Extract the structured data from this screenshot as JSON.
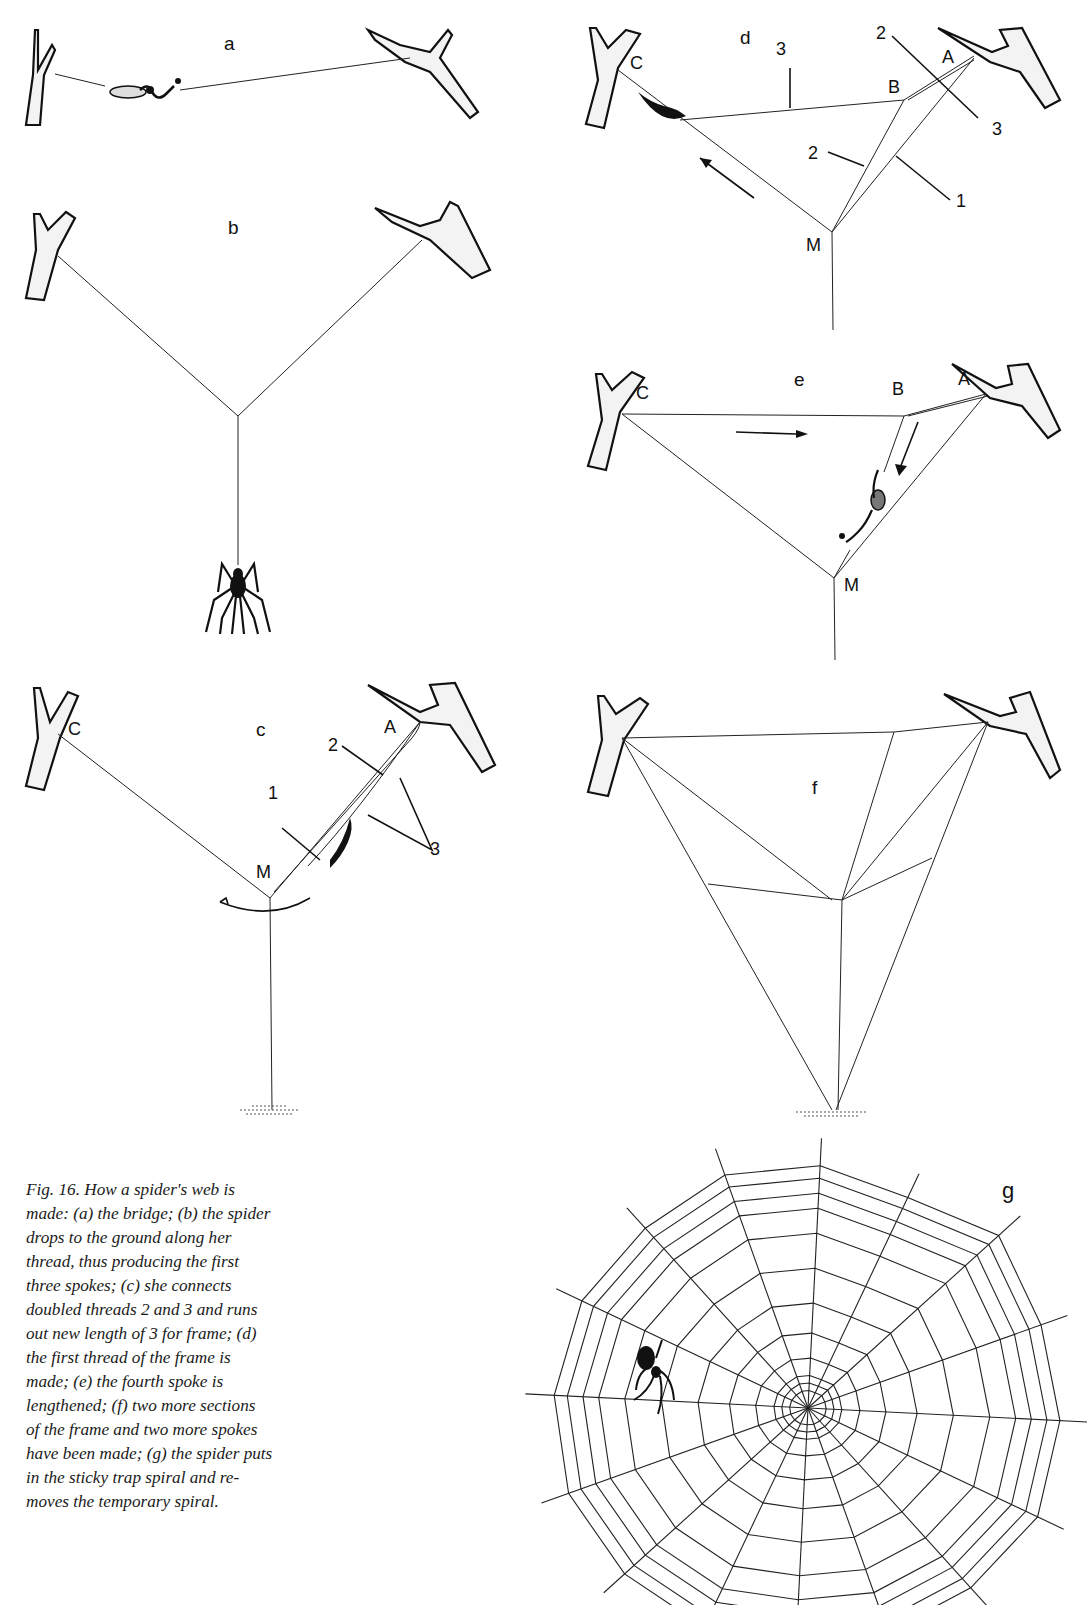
{
  "figure": {
    "number": "Fig. 16.",
    "panels": [
      {
        "id": "a",
        "label": "a",
        "description": "the bridge"
      },
      {
        "id": "b",
        "label": "b",
        "description": "the spider drops to the ground along her thread, thus producing the first three spokes"
      },
      {
        "id": "c",
        "label": "c",
        "description": "she connects doubled threads 2 and 3 and runs out new length of 3 for frame",
        "points": {
          "C": "C",
          "A": "A",
          "M": "M"
        },
        "threads": {
          "t1": "1",
          "t2": "2",
          "t3": "3"
        }
      },
      {
        "id": "d",
        "label": "d",
        "description": "the first thread of the frame is made",
        "points": {
          "C": "C",
          "B": "B",
          "A": "A",
          "M": "M"
        },
        "threads": {
          "t1": "1",
          "t2a": "2",
          "t2b": "2",
          "t3a": "3",
          "t3b": "3"
        }
      },
      {
        "id": "e",
        "label": "e",
        "description": "the fourth spoke is lengthened",
        "points": {
          "C": "C",
          "B": "B",
          "A": "A",
          "M": "M"
        }
      },
      {
        "id": "f",
        "label": "f",
        "description": "two more sections of the frame and two more spokes have been made"
      },
      {
        "id": "g",
        "label": "g",
        "description": "the spider puts in the sticky trap spiral and removes the temporary spiral"
      }
    ]
  },
  "caption": {
    "lines": [
      "Fig.  16.  How a spider's web is",
      "made: (a) the bridge; (b) the spider",
      "drops to the ground along her",
      "thread, thus producing the first",
      "three spokes; (c) she connects",
      "doubled threads 2 and 3 and runs",
      "out new length of 3 for frame; (d)",
      "the  first  thread  of  the  frame  is",
      "made; (e) the fourth spoke is",
      "lengthened; (f) two more sections",
      "of the frame and two more spokes",
      "have been made; (g) the spider puts",
      "in the sticky trap spiral and re-",
      "moves the temporary spiral."
    ]
  }
}
